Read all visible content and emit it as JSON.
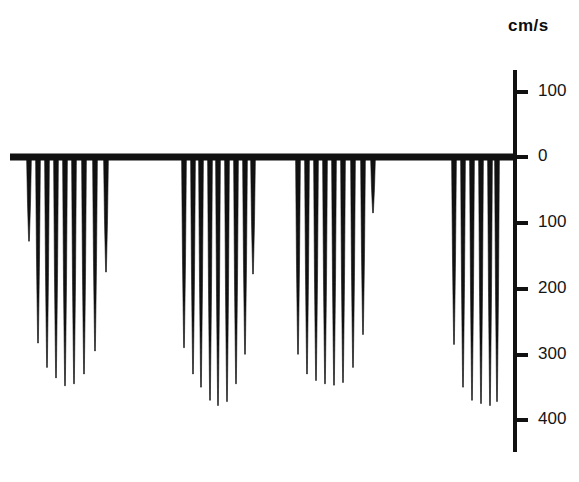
{
  "figure": {
    "title": "",
    "axis_unit_label": "cm/s",
    "background_color": "#ffffff",
    "trace_color": "#111111",
    "axis_color": "#111111"
  },
  "axis": {
    "unit": "cm/s",
    "tick_labels": [
      "100",
      "0",
      "100",
      "200",
      "300",
      "400"
    ],
    "tick_values": [
      100,
      0,
      -100,
      -200,
      -300,
      -400
    ],
    "tick_pixel_y": [
      92,
      157,
      223,
      289,
      355,
      420
    ],
    "axis_x": 515,
    "axis_top_y": 70,
    "axis_bottom_y": 452,
    "tick_length": 13,
    "baseline_y": 157,
    "baseline_x_start": 10,
    "baseline_x_end": 515
  },
  "chart_data": {
    "type": "line",
    "xlabel": "",
    "ylabel": "cm/s",
    "ylim": [
      130,
      -430
    ],
    "yticks": [
      100,
      0,
      -100,
      -200,
      -300,
      -400
    ],
    "ytick_labels": [
      "100",
      "0",
      "100",
      "200",
      "300",
      "400"
    ],
    "grid": false,
    "legend": "none",
    "baseline_value": 0,
    "note": "Four bursts of downward (negative) velocity spikes below the zero baseline; each spike is a thin tapered line whose tip depth is the peak velocity in cm/s.",
    "bursts": [
      {
        "name": "burst-1",
        "x_start_px": 27,
        "x_end_px": 114,
        "spikes": [
          {
            "x_px": 29,
            "peak_cm_s": -128
          },
          {
            "x_px": 38,
            "peak_cm_s": -283
          },
          {
            "x_px": 47,
            "peak_cm_s": -320
          },
          {
            "x_px": 56,
            "peak_cm_s": -336
          },
          {
            "x_px": 65,
            "peak_cm_s": -348
          },
          {
            "x_px": 74,
            "peak_cm_s": -345
          },
          {
            "x_px": 84,
            "peak_cm_s": -330
          },
          {
            "x_px": 95,
            "peak_cm_s": -295
          },
          {
            "x_px": 106,
            "peak_cm_s": -175
          }
        ]
      },
      {
        "name": "burst-2",
        "x_start_px": 182,
        "x_end_px": 255,
        "spikes": [
          {
            "x_px": 184,
            "peak_cm_s": -290
          },
          {
            "x_px": 193,
            "peak_cm_s": -330
          },
          {
            "x_px": 201,
            "peak_cm_s": -350
          },
          {
            "x_px": 210,
            "peak_cm_s": -370
          },
          {
            "x_px": 218,
            "peak_cm_s": -378
          },
          {
            "x_px": 227,
            "peak_cm_s": -372
          },
          {
            "x_px": 236,
            "peak_cm_s": -345
          },
          {
            "x_px": 245,
            "peak_cm_s": -300
          },
          {
            "x_px": 253,
            "peak_cm_s": -178
          }
        ]
      },
      {
        "name": "burst-3",
        "x_start_px": 296,
        "x_end_px": 376,
        "spikes": [
          {
            "x_px": 298,
            "peak_cm_s": -300
          },
          {
            "x_px": 307,
            "peak_cm_s": -330
          },
          {
            "x_px": 316,
            "peak_cm_s": -340
          },
          {
            "x_px": 325,
            "peak_cm_s": -345
          },
          {
            "x_px": 334,
            "peak_cm_s": -347
          },
          {
            "x_px": 343,
            "peak_cm_s": -343
          },
          {
            "x_px": 353,
            "peak_cm_s": -320
          },
          {
            "x_px": 363,
            "peak_cm_s": -270
          },
          {
            "x_px": 373,
            "peak_cm_s": -85
          }
        ]
      },
      {
        "name": "burst-4",
        "x_start_px": 452,
        "x_end_px": 499,
        "spikes": [
          {
            "x_px": 454,
            "peak_cm_s": -285
          },
          {
            "x_px": 463,
            "peak_cm_s": -350
          },
          {
            "x_px": 472,
            "peak_cm_s": -370
          },
          {
            "x_px": 481,
            "peak_cm_s": -375
          },
          {
            "x_px": 490,
            "peak_cm_s": -378
          },
          {
            "x_px": 497,
            "peak_cm_s": -372
          }
        ]
      }
    ]
  }
}
